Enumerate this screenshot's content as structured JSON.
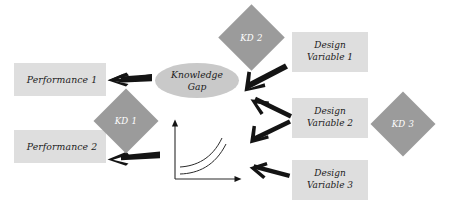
{
  "diagram": {
    "background_color": "#ffffff",
    "palette": {
      "box_fill": "#dedede",
      "ellipse_fill": "#c9c9c9",
      "diamond_fill": "#9b9b9b",
      "diamond_text": "#ffffff",
      "node_text": "#1b1b1b",
      "arrow_color": "#141414",
      "plot_stroke": "#2a2a2a"
    },
    "nodes": {
      "performance_1": {
        "label": "Performance 1",
        "shape": "rectangle"
      },
      "performance_2": {
        "label": "Performance 2",
        "shape": "rectangle"
      },
      "knowledge_gap": {
        "label_line1": "Knowledge",
        "label_line2": "Gap",
        "shape": "ellipse"
      },
      "kd_1": {
        "label": "KD 1",
        "shape": "diamond"
      },
      "kd_2": {
        "label": "KD 2",
        "shape": "diamond"
      },
      "kd_3": {
        "label": "KD 3",
        "shape": "diamond"
      },
      "design_variable_1": {
        "label_line1": "Design",
        "label_line2": "Variable 1",
        "shape": "rectangle"
      },
      "design_variable_2": {
        "label_line1": "Design",
        "label_line2": "Variable 2",
        "shape": "rectangle"
      },
      "design_variable_3": {
        "label_line1": "Design",
        "label_line2": "Variable 3",
        "shape": "rectangle"
      }
    },
    "plot": {
      "name": "trade-off-curves-plot",
      "axes": "x-y coordinate axes with arrowheads",
      "curves": 2,
      "curve_shape": "increasing convex",
      "has_tick_labels": false,
      "has_axis_labels": false
    },
    "arrows": [
      {
        "name": "arrow-knowledge-gap-to-performance-1",
        "direction": "left"
      },
      {
        "name": "arrow-plot-to-performance-2",
        "direction": "left"
      },
      {
        "name": "arrow-design-variable-1-to-knowledge-gap",
        "direction": "down-left"
      },
      {
        "name": "arrow-design-variable-2-to-knowledge-gap",
        "direction": "up-left"
      },
      {
        "name": "arrow-design-variable-2-to-plot",
        "direction": "down-left"
      },
      {
        "name": "arrow-design-variable-3-to-plot",
        "direction": "left"
      }
    ]
  }
}
